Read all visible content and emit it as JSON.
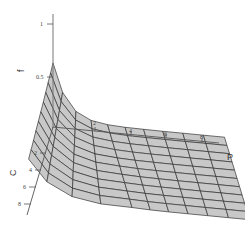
{
  "chart_data": {
    "type": "surface3d",
    "title": "",
    "axes": {
      "x": {
        "label": "P",
        "ticks": [
          "2",
          "4",
          "6",
          "8"
        ],
        "range": [
          0,
          9
        ]
      },
      "y": {
        "label": "C",
        "ticks": [
          "2",
          "4",
          "6",
          "8"
        ],
        "range": [
          0,
          9
        ]
      },
      "z": {
        "label": "f",
        "ticks": [
          "0.5",
          "1"
        ],
        "range": [
          0,
          1
        ]
      }
    },
    "surface": {
      "description": "f decreases as P increases; highest at P near 0, largest at back-left corner, flat plateau for large P",
      "fill_color": "#c8c8c8",
      "mesh_color": "#333333",
      "grid_rows": 10,
      "grid_cols": 10
    },
    "grid": false,
    "legend": null
  },
  "labels": {
    "f_axis": "f",
    "c_axis": "C",
    "p_axis": "P",
    "f_tick_1": "1",
    "f_tick_05": "0.5",
    "p_tick_2": "2",
    "p_tick_4": "4",
    "p_tick_6": "6",
    "p_tick_8": "8",
    "c_tick_2": "2",
    "c_tick_4": "4",
    "c_tick_6": "6",
    "c_tick_8": "8"
  }
}
